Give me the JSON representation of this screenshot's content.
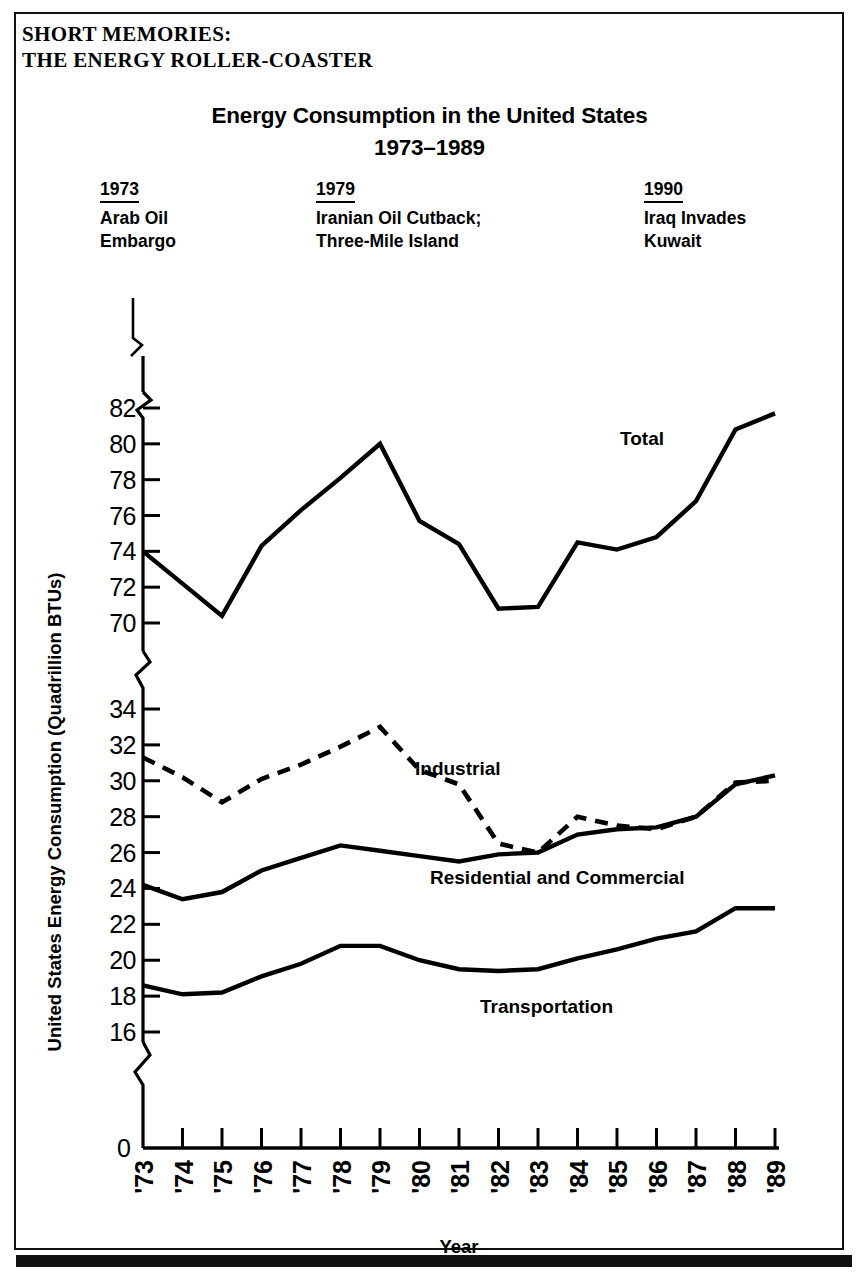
{
  "masthead": {
    "line1": "SHORT MEMORIES:",
    "line2": "THE ENERGY ROLLER-COASTER"
  },
  "chart_title": {
    "main": "Energy Consumption in the United States",
    "sub": "1973–1989"
  },
  "events": [
    {
      "year": "1973",
      "desc": "Arab Oil\nEmbargo"
    },
    {
      "year": "1979",
      "desc": "Iranian Oil Cutback;\nThree-Mile Island"
    },
    {
      "year": "1990",
      "desc": "Iraq Invades\nKuwait"
    }
  ],
  "chart_data": {
    "type": "line",
    "xlabel": "Year",
    "ylabel": "United States Energy Consumption (Quadrillion BTUs)",
    "grid": false,
    "legend": "inline-annotations",
    "broken_axis": true,
    "axis_breaks": [
      "below 16",
      "between 34 and 70",
      "above 82"
    ],
    "categories": [
      "'73",
      "'74",
      "'75",
      "'76",
      "'77",
      "'78",
      "'79",
      "'80",
      "'81",
      "'82",
      "'83",
      "'84",
      "'85",
      "'86",
      "'87",
      "'88",
      "'89"
    ],
    "x": [
      1973,
      1974,
      1975,
      1976,
      1977,
      1978,
      1979,
      1980,
      1981,
      1982,
      1983,
      1984,
      1985,
      1986,
      1987,
      1988,
      1989
    ],
    "y_lower_ticks": [
      16,
      18,
      20,
      22,
      24,
      26,
      28,
      30,
      32,
      34
    ],
    "y_upper_ticks": [
      70,
      72,
      74,
      76,
      78,
      80,
      82
    ],
    "y_zero_tick": "0",
    "series": [
      {
        "name": "Total",
        "style": "solid",
        "panel": "upper",
        "values": [
          74.0,
          72.2,
          70.4,
          74.3,
          76.3,
          78.1,
          80.0,
          75.7,
          74.4,
          70.8,
          70.9,
          74.5,
          74.1,
          74.8,
          76.8,
          80.8,
          81.7
        ]
      },
      {
        "name": "Industrial",
        "style": "dashed",
        "panel": "lower",
        "values": [
          31.3,
          30.2,
          28.8,
          30.1,
          30.9,
          31.9,
          33.0,
          30.6,
          29.8,
          26.5,
          26.0,
          28.0,
          27.5,
          27.3,
          28.0,
          29.9,
          30.0
        ]
      },
      {
        "name": "Residential and Commercial",
        "style": "solid",
        "panel": "lower",
        "values": [
          24.2,
          23.4,
          23.8,
          25.0,
          25.7,
          26.4,
          26.1,
          25.8,
          25.5,
          25.9,
          26.0,
          27.0,
          27.3,
          27.4,
          28.0,
          29.8,
          30.3
        ]
      },
      {
        "name": "Transportation",
        "style": "solid",
        "panel": "lower",
        "values": [
          18.6,
          18.1,
          18.2,
          19.1,
          19.8,
          20.8,
          20.8,
          20.0,
          19.5,
          19.4,
          19.5,
          20.1,
          20.6,
          21.2,
          21.6,
          22.9,
          22.9
        ]
      }
    ],
    "series_label_positions": [
      {
        "name": "Total",
        "x": 620,
        "y": 445
      },
      {
        "name": "Industrial",
        "x": 415,
        "y": 775
      },
      {
        "name": "Residential and Commercial",
        "x": 430,
        "y": 884
      },
      {
        "name": "Transportation",
        "x": 480,
        "y": 1013
      }
    ]
  }
}
